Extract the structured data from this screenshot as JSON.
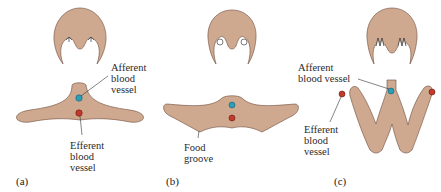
{
  "figure": {
    "panels": [
      {
        "id": "a",
        "label": "(a)"
      },
      {
        "id": "b",
        "label": "(b)"
      },
      {
        "id": "c",
        "label": "(c)"
      }
    ],
    "annotations": {
      "a_afferent": [
        "Afferent",
        "blood",
        "vessel"
      ],
      "a_efferent": [
        "Efferent",
        "blood",
        "vessel"
      ],
      "b_food": [
        "Food",
        "groove"
      ],
      "c_afferent": [
        "Afferent",
        "blood vessel"
      ],
      "c_efferent": [
        "Efferent",
        "blood",
        "vessel"
      ]
    },
    "colors": {
      "tissue": "#cfa98f",
      "outline": "#6b4a3a",
      "afferent_vessel": "#2a9fb8",
      "efferent_vessel": "#c23a2a"
    }
  }
}
